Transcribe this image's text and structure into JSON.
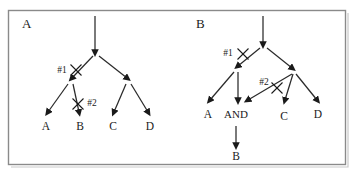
{
  "figure": {
    "frame": {
      "x": 8,
      "y": 10,
      "width": 338,
      "height": 155,
      "border_color": "#8a8a8a"
    },
    "panels": [
      {
        "id": "panel-a",
        "letter": "A",
        "letter_pos": {
          "x": 22,
          "y": 28
        },
        "root_arrow": {
          "x1": 95,
          "y1": 16,
          "x2": 95,
          "y2": 52
        },
        "edges": [
          {
            "id": "a-root-left",
            "x1": 93,
            "y1": 56,
            "x2": 72,
            "y2": 78,
            "cut": true,
            "cut_id": "#1"
          },
          {
            "id": "a-root-right",
            "x1": 99,
            "y1": 56,
            "x2": 127,
            "y2": 78,
            "cut": false,
            "cut_id": ""
          },
          {
            "id": "a-left-A",
            "x1": 68,
            "y1": 84,
            "x2": 48,
            "y2": 112,
            "cut": false,
            "cut_id": ""
          },
          {
            "id": "a-left-B",
            "x1": 73,
            "y1": 84,
            "x2": 79,
            "y2": 112,
            "cut": true,
            "cut_id": "#2"
          },
          {
            "id": "a-right-C",
            "x1": 126,
            "y1": 84,
            "x2": 114,
            "y2": 112,
            "cut": false,
            "cut_id": ""
          },
          {
            "id": "a-right-D",
            "x1": 131,
            "y1": 84,
            "x2": 148,
            "y2": 112,
            "cut": false,
            "cut_id": ""
          }
        ],
        "cut_marks": [
          {
            "id": "a-cut-1",
            "label": "#1",
            "label_x": 62,
            "label_y": 73,
            "cross_x": 76,
            "cross_y": 70,
            "size": 5.5
          },
          {
            "id": "a-cut-2",
            "label": "#2",
            "label_x": 92,
            "label_y": 106,
            "cross_x": 78,
            "cross_y": 104,
            "size": 5.5
          }
        ],
        "leaves": [
          {
            "id": "a-leaf-A",
            "label": "A",
            "x": 46,
            "y": 130
          },
          {
            "id": "a-leaf-B",
            "label": "B",
            "x": 80,
            "y": 130
          },
          {
            "id": "a-leaf-C",
            "label": "C",
            "x": 113,
            "y": 130
          },
          {
            "id": "a-leaf-D",
            "label": "D",
            "x": 150,
            "y": 130
          }
        ]
      },
      {
        "id": "panel-b",
        "letter": "B",
        "letter_pos": {
          "x": 196,
          "y": 28
        },
        "root_arrow": {
          "x1": 263,
          "y1": 16,
          "x2": 263,
          "y2": 44
        },
        "edges": [
          {
            "id": "b-root-left",
            "x1": 260,
            "y1": 48,
            "x2": 238,
            "y2": 66,
            "cut": true,
            "cut_id": "#1"
          },
          {
            "id": "b-root-right",
            "x1": 267,
            "y1": 48,
            "x2": 292,
            "y2": 68,
            "cut": false,
            "cut_id": ""
          },
          {
            "id": "b-left-A",
            "x1": 234,
            "y1": 72,
            "x2": 210,
            "y2": 100,
            "cut": false,
            "cut_id": ""
          },
          {
            "id": "b-left-AND",
            "x1": 238,
            "y1": 72,
            "x2": 238,
            "y2": 100,
            "cut": false,
            "cut_id": ""
          },
          {
            "id": "b-cross-AND",
            "x1": 292,
            "y1": 74,
            "x2": 248,
            "y2": 100,
            "cut": true,
            "cut_id": "#2"
          },
          {
            "id": "b-right-C",
            "x1": 293,
            "y1": 74,
            "x2": 285,
            "y2": 100,
            "cut": false,
            "cut_id": ""
          },
          {
            "id": "b-right-D",
            "x1": 296,
            "y1": 74,
            "x2": 317,
            "y2": 100,
            "cut": false,
            "cut_id": ""
          },
          {
            "id": "b-and-B",
            "x1": 236,
            "y1": 126,
            "x2": 236,
            "y2": 145,
            "cut": false,
            "cut_id": ""
          }
        ],
        "cut_marks": [
          {
            "id": "b-cut-1",
            "label": "#1",
            "label_x": 228,
            "label_y": 56,
            "cross_x": 243,
            "cross_y": 54,
            "size": 5.5
          },
          {
            "id": "b-cut-2",
            "label": "#2",
            "label_x": 264,
            "label_y": 85,
            "cross_x": 277,
            "cross_y": 88,
            "size": 5.5
          }
        ],
        "leaves": [
          {
            "id": "b-leaf-A",
            "label": "A",
            "x": 208,
            "y": 118
          },
          {
            "id": "b-leaf-AND",
            "label": "AND",
            "x": 236,
            "y": 118
          },
          {
            "id": "b-leaf-C",
            "label": "C",
            "x": 284,
            "y": 120
          },
          {
            "id": "b-leaf-D",
            "label": "D",
            "x": 318,
            "y": 118
          },
          {
            "id": "b-leaf-B",
            "label": "B",
            "x": 236,
            "y": 160
          }
        ]
      }
    ],
    "colors": {
      "ink": "#1a1a1a",
      "edge": "#2a2a2a",
      "frame": "#8a8a8a",
      "background": "#ffffff"
    }
  }
}
